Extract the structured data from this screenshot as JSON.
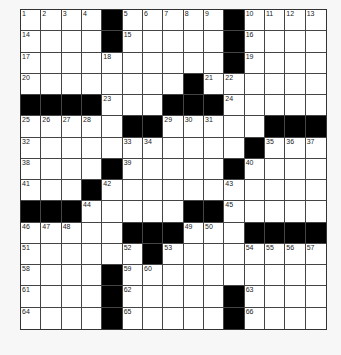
{
  "puzzle": {
    "rows": 15,
    "cols": 15,
    "layout": [
      "....#.....#....",
      "....#.....#....",
      "..........#....",
      "........#......",
      "####...###.....",
      ".....##.....###",
      "...........#...",
      "....#.....#....",
      "...#...........",
      "###.....##.....",
      ".....###...#####",
      "......#........",
      "....#..........",
      "....#.....#....",
      "....#.....#...."
    ],
    "numbers": [
      {
        "r": 0,
        "c": 0,
        "n": "1"
      },
      {
        "r": 0,
        "c": 1,
        "n": "2"
      },
      {
        "r": 0,
        "c": 2,
        "n": "3"
      },
      {
        "r": 0,
        "c": 3,
        "n": "4"
      },
      {
        "r": 0,
        "c": 5,
        "n": "5"
      },
      {
        "r": 0,
        "c": 6,
        "n": "6"
      },
      {
        "r": 0,
        "c": 7,
        "n": "7"
      },
      {
        "r": 0,
        "c": 8,
        "n": "8"
      },
      {
        "r": 0,
        "c": 9,
        "n": "9"
      },
      {
        "r": 0,
        "c": 11,
        "n": "10"
      },
      {
        "r": 0,
        "c": 12,
        "n": "11"
      },
      {
        "r": 0,
        "c": 13,
        "n": "12"
      },
      {
        "r": 0,
        "c": 14,
        "n": "13"
      },
      {
        "r": 1,
        "c": 0,
        "n": "14"
      },
      {
        "r": 1,
        "c": 5,
        "n": "15"
      },
      {
        "r": 1,
        "c": 11,
        "n": "16"
      },
      {
        "r": 2,
        "c": 0,
        "n": "17"
      },
      {
        "r": 2,
        "c": 4,
        "n": "18"
      },
      {
        "r": 2,
        "c": 11,
        "n": "19"
      },
      {
        "r": 3,
        "c": 0,
        "n": "20"
      },
      {
        "r": 3,
        "c": 9,
        "n": "21"
      },
      {
        "r": 3,
        "c": 10,
        "n": "22"
      },
      {
        "r": 4,
        "c": 4,
        "n": "23"
      },
      {
        "r": 4,
        "c": 10,
        "n": "24"
      },
      {
        "r": 5,
        "c": 0,
        "n": "25"
      },
      {
        "r": 5,
        "c": 1,
        "n": "26"
      },
      {
        "r": 5,
        "c": 2,
        "n": "27"
      },
      {
        "r": 5,
        "c": 3,
        "n": "28"
      },
      {
        "r": 5,
        "c": 7,
        "n": "29"
      },
      {
        "r": 5,
        "c": 8,
        "n": "30"
      },
      {
        "r": 5,
        "c": 9,
        "n": "31"
      },
      {
        "r": 6,
        "c": 0,
        "n": "32"
      },
      {
        "r": 6,
        "c": 5,
        "n": "33"
      },
      {
        "r": 6,
        "c": 6,
        "n": "34"
      },
      {
        "r": 6,
        "c": 12,
        "n": "35"
      },
      {
        "r": 6,
        "c": 13,
        "n": "36"
      },
      {
        "r": 6,
        "c": 14,
        "n": "37"
      },
      {
        "r": 7,
        "c": 0,
        "n": "38"
      },
      {
        "r": 7,
        "c": 5,
        "n": "39"
      },
      {
        "r": 7,
        "c": 11,
        "n": "40"
      },
      {
        "r": 8,
        "c": 0,
        "n": "41"
      },
      {
        "r": 8,
        "c": 4,
        "n": "42"
      },
      {
        "r": 8,
        "c": 10,
        "n": "43"
      },
      {
        "r": 9,
        "c": 3,
        "n": "44"
      },
      {
        "r": 9,
        "c": 10,
        "n": "45"
      },
      {
        "r": 10,
        "c": 0,
        "n": "46"
      },
      {
        "r": 10,
        "c": 1,
        "n": "47"
      },
      {
        "r": 10,
        "c": 2,
        "n": "48"
      },
      {
        "r": 10,
        "c": 8,
        "n": "49"
      },
      {
        "r": 10,
        "c": 9,
        "n": "50"
      },
      {
        "r": 11,
        "c": 0,
        "n": "51"
      },
      {
        "r": 11,
        "c": 5,
        "n": "52"
      },
      {
        "r": 11,
        "c": 7,
        "n": "53"
      },
      {
        "r": 11,
        "c": 11,
        "n": "54"
      },
      {
        "r": 11,
        "c": 12,
        "n": "55"
      },
      {
        "r": 11,
        "c": 13,
        "n": "56"
      },
      {
        "r": 11,
        "c": 14,
        "n": "57"
      },
      {
        "r": 12,
        "c": 0,
        "n": "58"
      },
      {
        "r": 12,
        "c": 5,
        "n": "59"
      },
      {
        "r": 12,
        "c": 6,
        "n": "60"
      },
      {
        "r": 13,
        "c": 0,
        "n": "61"
      },
      {
        "r": 13,
        "c": 5,
        "n": "62"
      },
      {
        "r": 13,
        "c": 11,
        "n": "63"
      },
      {
        "r": 14,
        "c": 0,
        "n": "64"
      },
      {
        "r": 14,
        "c": 5,
        "n": "65"
      },
      {
        "r": 14,
        "c": 11,
        "n": "66"
      }
    ]
  }
}
